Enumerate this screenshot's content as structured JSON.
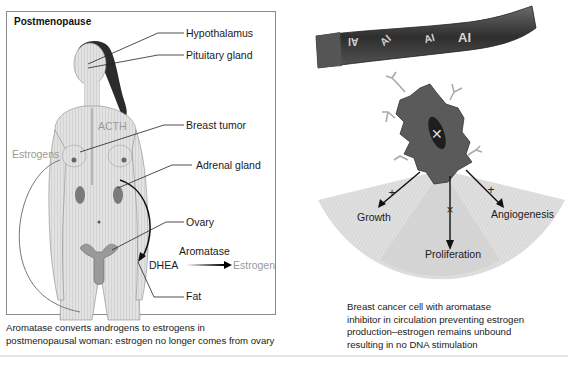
{
  "left_panel": {
    "title": "Postmenopause",
    "labels": {
      "hypothalamus": "Hypothalamus",
      "pituitary": "Pituitary gland",
      "breast_tumor": "Breast tumor",
      "adrenal": "Adrenal gland",
      "ovary": "Ovary",
      "fat": "Fat",
      "acth": "ACTH",
      "estrogens": "Estrogens",
      "aromatase": "Aromatase",
      "dhea": "DHEA",
      "estrogen": "Estrogen"
    },
    "caption_line1": "Aromatase converts androgens to estrogens in",
    "caption_line2": "postmenopausal woman: estrogen no longer comes from ovary"
  },
  "right_panel": {
    "vessel_labels": [
      "AI",
      "AI",
      "AI",
      "AI"
    ],
    "outcomes": {
      "growth": "Growth",
      "proliferation": "Proliferation",
      "angiogenesis": "Angiogenesis"
    },
    "blocked_marker": "×",
    "caption_line1": "Breast cancer cell with aromatase",
    "caption_line2": "inhibitor in circulation preventing estrogen",
    "caption_line3": "production–estrogen remains unbound",
    "caption_line4": "resulting in no DNA stimulation"
  },
  "colors": {
    "box_border": "#8a8a8a",
    "gray_label": "#9a9a9a",
    "cell_fill": "#5a5a5a",
    "vessel_fill": "#3c3c3c",
    "fan_fill": "#d6d6d6"
  }
}
